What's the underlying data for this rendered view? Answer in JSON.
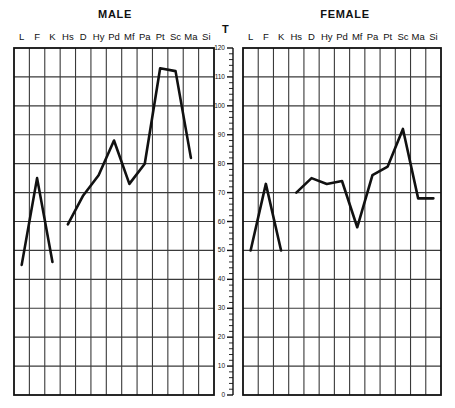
{
  "axis": {
    "t_label": "T",
    "ticks": [
      0,
      10,
      20,
      30,
      40,
      50,
      60,
      70,
      80,
      90,
      100,
      110,
      120
    ],
    "min": 0,
    "max": 120,
    "minor_step": 2
  },
  "scales": [
    "L",
    "F",
    "K",
    "Hs",
    "D",
    "Hy",
    "Pd",
    "Mf",
    "Pa",
    "Pt",
    "Sc",
    "Ma",
    "Si"
  ],
  "panels": [
    {
      "title": "MALE"
    },
    {
      "title": "FEMALE"
    }
  ],
  "colors": {
    "line": "#111111",
    "grid": "#3a3a3a",
    "frame": "#111111",
    "background": "#ffffff"
  },
  "chart_data": {
    "type": "line",
    "xlabel": "",
    "ylabel": "T",
    "ylim": [
      0,
      120
    ],
    "grid": true,
    "legend": "none",
    "categories": [
      "L",
      "F",
      "K",
      "Hs",
      "D",
      "Hy",
      "Pd",
      "Mf",
      "Pa",
      "Pt",
      "Sc",
      "Ma",
      "Si"
    ],
    "panels": [
      {
        "name": "MALE",
        "segments": [
          {
            "categories": [
              "L",
              "F",
              "K"
            ],
            "values": [
              45,
              75,
              46
            ]
          },
          {
            "categories": [
              "Hs",
              "D",
              "Hy",
              "Pd",
              "Mf",
              "Pa",
              "Pt",
              "Sc",
              "Ma"
            ],
            "values": [
              59,
              69,
              76,
              88,
              73,
              80,
              113,
              112,
              82
            ]
          }
        ],
        "series": [
          {
            "name": "MALE",
            "values": [
              45,
              75,
              46,
              59,
              69,
              76,
              88,
              73,
              80,
              113,
              112,
              82,
              null
            ]
          }
        ]
      },
      {
        "name": "FEMALE",
        "segments": [
          {
            "categories": [
              "L",
              "F",
              "K"
            ],
            "values": [
              50,
              73,
              50
            ]
          },
          {
            "categories": [
              "Hs",
              "D",
              "Hy",
              "Pd",
              "Mf",
              "Pa",
              "Pt",
              "Sc",
              "Ma",
              "Si"
            ],
            "values": [
              70,
              75,
              73,
              74,
              58,
              76,
              79,
              92,
              68,
              68
            ]
          }
        ],
        "series": [
          {
            "name": "FEMALE",
            "values": [
              50,
              73,
              50,
              70,
              75,
              73,
              74,
              58,
              76,
              79,
              92,
              68,
              68
            ]
          }
        ]
      }
    ]
  }
}
